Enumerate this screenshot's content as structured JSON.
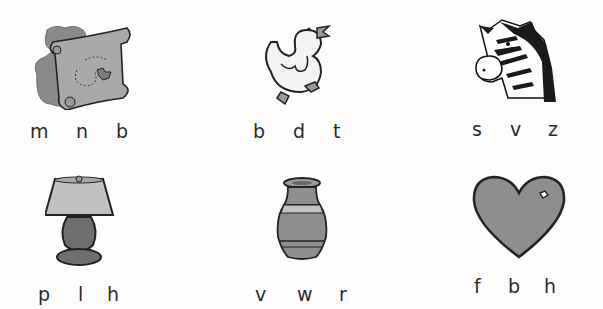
{
  "worksheet": {
    "items": [
      {
        "picture": "treasure-map",
        "letters": [
          "m",
          "n",
          "b"
        ]
      },
      {
        "picture": "duck",
        "letters": [
          "b",
          "d",
          "t"
        ]
      },
      {
        "picture": "zebra",
        "letters": [
          "s",
          "v",
          "z"
        ]
      },
      {
        "picture": "lamp",
        "letters": [
          "p",
          "l",
          "h"
        ]
      },
      {
        "picture": "vase",
        "letters": [
          "v",
          "w",
          "r"
        ]
      },
      {
        "picture": "heart",
        "letters": [
          "f",
          "b",
          "h"
        ]
      }
    ]
  },
  "colors": {
    "ink": "#222222",
    "fill_gray": "#8c8c8c",
    "light_gray": "#bdbdbd"
  }
}
